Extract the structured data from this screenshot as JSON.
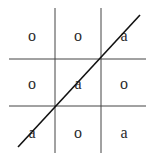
{
  "board": {
    "rows": [
      [
        "o",
        "o",
        "a"
      ],
      [
        "o",
        "a",
        "o"
      ],
      [
        "a",
        "o",
        "a"
      ]
    ],
    "winning_line": {
      "from": "bottom-left",
      "to": "top-right",
      "cells": [
        [
          2,
          0
        ],
        [
          1,
          1
        ],
        [
          0,
          2
        ]
      ],
      "symbol": "a"
    },
    "line_color": "#333333",
    "strike_color": "#111111"
  }
}
